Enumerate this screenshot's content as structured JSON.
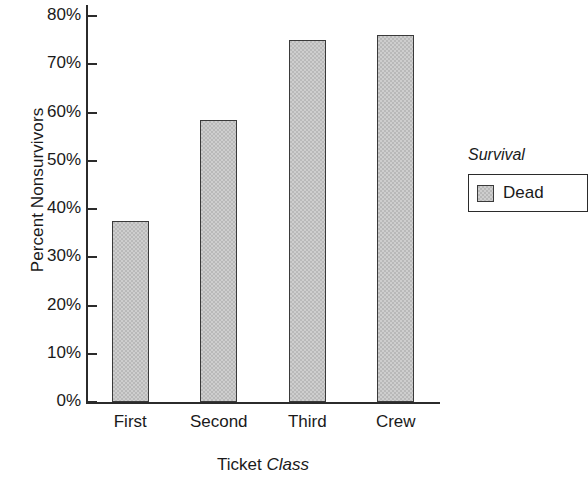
{
  "chart_data": {
    "type": "bar",
    "title": "",
    "categories": [
      "First",
      "Second",
      "Third",
      "Crew"
    ],
    "values": [
      37.5,
      58.5,
      75,
      76
    ],
    "series": [
      {
        "name": "Dead",
        "values": [
          37.5,
          58.5,
          75,
          76
        ]
      }
    ],
    "xlabel_plain": "Ticket",
    "xlabel_italic": "Class",
    "ylabel": "Percent Nonsurvivors",
    "ylim": [
      0,
      80
    ],
    "ytick_values": [
      0,
      10,
      20,
      30,
      40,
      50,
      60,
      70,
      80
    ],
    "ytick_labels": [
      "0%",
      "10%",
      "20%",
      "30%",
      "40%",
      "50%",
      "60%",
      "70%",
      "80%"
    ],
    "grid": false,
    "legend": {
      "title": "Survival",
      "position": "right",
      "entries": [
        {
          "label": "Dead",
          "color": "#b9b9b9"
        }
      ]
    },
    "colors": {
      "bar_fill": "#b9b9b9",
      "bar_stroke": "#3a3a3a",
      "axis": "#2b2b2b",
      "text": "#1a1a1a",
      "background": "#ffffff"
    }
  }
}
